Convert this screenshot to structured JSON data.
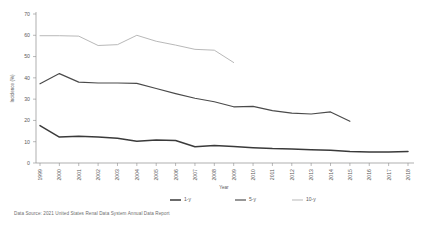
{
  "chart_data": {
    "type": "line",
    "title": "",
    "xlabel": "Year",
    "ylabel": "Incidence (%)",
    "ylim": [
      0,
      70
    ],
    "ytick_values": [
      0,
      10,
      20,
      30,
      40,
      50,
      60,
      70
    ],
    "ytick_labels": [
      "0",
      "10",
      "20",
      "30",
      "40",
      "50",
      "60",
      "70"
    ],
    "grid": false,
    "legend_position": "bottom",
    "categories": [
      "1999",
      "2000",
      "2001",
      "2002",
      "2003",
      "2004",
      "2005",
      "2006",
      "2007",
      "2008",
      "2009",
      "2010",
      "2011",
      "2012",
      "2013",
      "2014",
      "2015",
      "2016",
      "2017",
      "2018"
    ],
    "series": [
      {
        "name": "1-y",
        "color": "#3a3a3a",
        "width": 1.5,
        "values": [
          17.6,
          12.2,
          12.6,
          12.2,
          11.6,
          10.2,
          10.8,
          10.6,
          7.6,
          8.2,
          7.8,
          7.2,
          6.8,
          6.6,
          6.2,
          6.0,
          5.4,
          5.2,
          5.2,
          5.4
        ]
      },
      {
        "name": "5-y",
        "color": "#4a4a4a",
        "width": 1.15,
        "values": [
          37.2,
          42.0,
          38.0,
          37.6,
          37.6,
          37.4,
          35.0,
          32.6,
          30.4,
          28.8,
          26.4,
          26.6,
          24.6,
          23.4,
          23.0,
          24.0,
          19.6,
          null,
          null,
          null
        ]
      },
      {
        "name": "10-y",
        "color": "#b4b4b4",
        "width": 0.95,
        "values": [
          59.8,
          59.8,
          59.6,
          55.2,
          55.6,
          60.0,
          57.2,
          55.4,
          53.4,
          53.0,
          47.2,
          null,
          null,
          null,
          null,
          null,
          null,
          null,
          null,
          null
        ]
      }
    ],
    "legend": [
      {
        "label": "1-y",
        "color": "#3a3a3a",
        "width": 1.5
      },
      {
        "label": "5-y",
        "color": "#4a4a4a",
        "width": 1.15
      },
      {
        "label": "10-y",
        "color": "#b4b4b4",
        "width": 0.95
      }
    ],
    "source_note": "Data Source: 2021 United States Renal Data System Annual Data Report"
  }
}
